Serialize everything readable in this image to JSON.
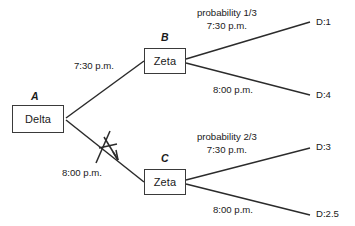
{
  "diagram": {
    "type": "decision-tree",
    "background_color": "#ffffff",
    "line_color": "#2b2b2b",
    "text_color": "#1a1a1a"
  },
  "nodes": {
    "root": {
      "letter": "A",
      "label": "Delta"
    },
    "upper": {
      "letter": "B",
      "label": "Zeta"
    },
    "lower": {
      "letter": "C",
      "label": "Zeta"
    }
  },
  "root_branches": {
    "upper_label": "7:30 p.m.",
    "lower_label": "8:00 p.m.",
    "lower_pruned": true
  },
  "upper_subtree": {
    "probability": "probability 1/3",
    "upper_time": "7:30 p.m.",
    "upper_payoff": "D:1",
    "lower_time": "8:00 p.m.",
    "lower_payoff": "D:4"
  },
  "lower_subtree": {
    "probability": "probability 2/3",
    "upper_time": "7:30 p.m.",
    "upper_payoff": "D:3",
    "lower_time": "8:00 p.m.",
    "lower_payoff": "D:2.5"
  }
}
